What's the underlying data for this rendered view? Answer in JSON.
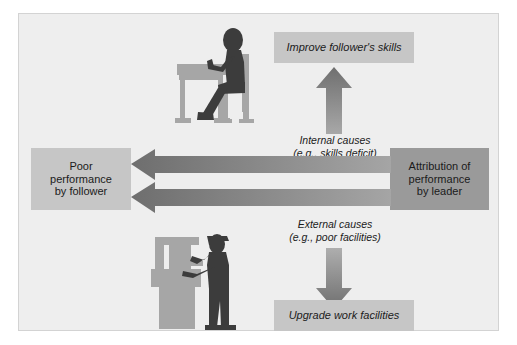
{
  "diagram": {
    "title_visible": false,
    "boxes": {
      "improve_skills": {
        "label": "Improve follower's skills",
        "style": "light"
      },
      "upgrade_facilities": {
        "label": "Upgrade work facilities",
        "style": "light"
      },
      "poor_performance": {
        "label_line1": "Poor",
        "label_line2": "performance",
        "label_line3": "by follower",
        "style": "light"
      },
      "attribution": {
        "label_line1": "Attribution of",
        "label_line2": "performance",
        "label_line3": "by leader",
        "style": "dark"
      }
    },
    "annotations": {
      "internal_causes": {
        "line1": "Internal causes",
        "line2": "(e.g., skills deficit)"
      },
      "external_causes": {
        "line1": "External causes",
        "line2": "(e.g., poor facilities)"
      }
    },
    "arrows": [
      {
        "name": "internal-causes-up-arrow",
        "direction": "up"
      },
      {
        "name": "external-causes-down-arrow",
        "direction": "down"
      },
      {
        "name": "upper-feedback-left-arrow",
        "direction": "left"
      },
      {
        "name": "lower-feedback-left-arrow",
        "direction": "left"
      }
    ],
    "figures": [
      {
        "name": "seated-worker-at-desk-illustration",
        "description": "person seated at desk writing"
      },
      {
        "name": "standing-worker-at-machine-illustration",
        "description": "person standing operating a machine"
      }
    ],
    "colors": {
      "canvas": "#eeeeee",
      "box_light": "#c6c6c6",
      "box_dark": "#9a9a9a",
      "arrow": "#868686",
      "figure_person": "#3c3c3c",
      "figure_furniture": "#a6a6a6",
      "text": "#1b1b1b"
    }
  }
}
